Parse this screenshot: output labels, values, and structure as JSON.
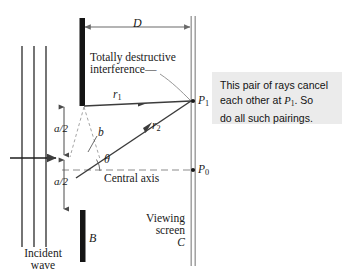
{
  "figure": {
    "type": "physics-optics-diagram"
  },
  "colors": {
    "barrier": "#141414",
    "wave_line": "#6e6e6e",
    "ray": "#3c3c3c",
    "screen": "#9a9a9a",
    "axis_dash": "#8c8c8c",
    "callout_bg": "#ebebeb",
    "text": "#1a1a1a"
  },
  "labels": {
    "distance_D": "D",
    "ray_1": "r",
    "ray_1_sub": "1",
    "ray_2": "r",
    "ray_2_sub": "2",
    "path_diff_b": "b",
    "theta": "θ",
    "half_slit_top": "a/2",
    "half_slit_bottom": "a/2",
    "central_axis": "Central axis",
    "annotation_line1": "Totally destructive",
    "annotation_line2": "interference",
    "point_P1": "P",
    "point_P1_sub": "1",
    "point_P0": "P",
    "point_P0_sub": "0",
    "barrier_B": "B",
    "screen_name_line1": "Viewing",
    "screen_name_line2": "screen",
    "screen_letter_C": "C",
    "incident_line1": "Incident",
    "incident_line2": "wave"
  },
  "callout": {
    "line1": "This pair of rays cancel",
    "line2_a": "each other at ",
    "line2_P": "P",
    "line2_sub": "1",
    "line2_b": ". So",
    "line3": "do all such pairings."
  },
  "geometry": {
    "barrier_top_x": 83,
    "barrier_top_y1": 18,
    "barrier_top_y2": 106,
    "barrier_bottom_x": 83,
    "barrier_bottom_y1": 210,
    "barrier_bottom_y2": 262,
    "screen_x": 193,
    "screen_y1": 16,
    "screen_y2": 266,
    "slit_center_y": 157,
    "P1_y": 101,
    "P0_y": 170,
    "wave_x": [
      22,
      34,
      46
    ],
    "wave_y1": 46,
    "wave_y2": 247
  }
}
